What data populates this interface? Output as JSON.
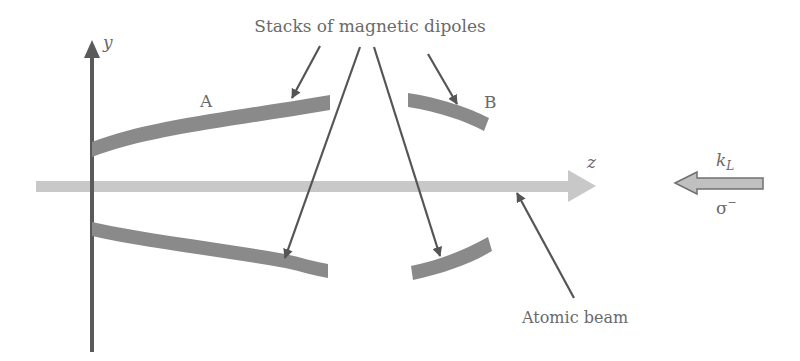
{
  "diagram": {
    "title_label": "Stacks of magnetic dipoles",
    "axes": {
      "y_label": "y",
      "z_label": "z"
    },
    "stacks": {
      "a_label": "A",
      "b_label": "B"
    },
    "beam": {
      "label": "Atomic beam"
    },
    "laser": {
      "k_label": "k",
      "k_subscript": "L",
      "polarization": "σ",
      "polarization_sup": "−"
    },
    "colors": {
      "axis": "#5a5a5a",
      "stack": "#8a8a8a",
      "beam": "#c8c8c8",
      "laser_fill": "#c0c0c0",
      "laser_stroke": "#707070",
      "pointer": "#555555",
      "text": "#6a6a6a"
    }
  }
}
